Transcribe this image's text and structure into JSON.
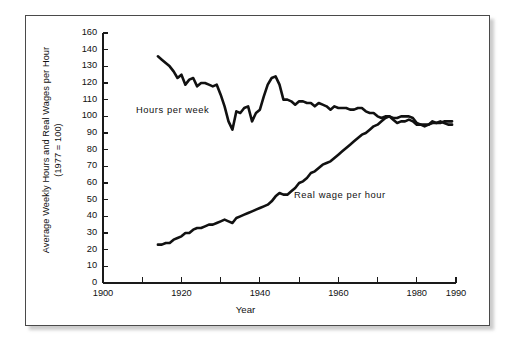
{
  "figure": {
    "y_axis_title_line1": "Average Weekly Hours and Real Wages per Hour",
    "y_axis_title_line2": "(1977 = 100)",
    "x_axis_title": "Year",
    "line_color": "#111111",
    "axis_color": "#1a1a1a",
    "frame_color": "#4a4a4a",
    "background": "#ffffff"
  },
  "chart_data": {
    "type": "line",
    "title": "",
    "subtitle": "",
    "xlabel": "Year",
    "ylabel": "Average Weekly Hours and Real Wages per Hour (1977 = 100)",
    "xlim": [
      1900,
      1990
    ],
    "ylim": [
      0,
      160
    ],
    "grid": false,
    "legend_position": "inline-annotations",
    "x_ticks": [
      1900,
      1910,
      1920,
      1930,
      1940,
      1950,
      1960,
      1970,
      1980,
      1990
    ],
    "x_tick_labels": [
      "1900",
      "",
      "1920",
      "",
      "1940",
      "",
      "1960",
      "",
      "1980",
      "1990"
    ],
    "y_ticks": [
      0,
      10,
      20,
      30,
      40,
      50,
      60,
      70,
      80,
      90,
      100,
      110,
      120,
      130,
      140,
      160
    ],
    "y_tick_labels": [
      "0",
      "10",
      "20",
      "30",
      "40",
      "50",
      "60",
      "70",
      "80",
      "90",
      "100",
      "110",
      "120",
      "130",
      "140",
      "160"
    ],
    "annotations": [
      {
        "text": "Hours per week",
        "x": 1920,
        "y": 110
      },
      {
        "text": "Real wage per hour",
        "x": 1958,
        "y": 55
      }
    ],
    "series": [
      {
        "name": "Hours per week",
        "label": "Hours per week",
        "color": "#111111",
        "x": [
          1914,
          1915,
          1916,
          1917,
          1918,
          1919,
          1920,
          1921,
          1922,
          1923,
          1924,
          1925,
          1926,
          1927,
          1928,
          1929,
          1930,
          1931,
          1932,
          1933,
          1934,
          1935,
          1936,
          1937,
          1938,
          1939,
          1940,
          1941,
          1942,
          1943,
          1944,
          1945,
          1946,
          1947,
          1948,
          1949,
          1950,
          1951,
          1952,
          1953,
          1954,
          1955,
          1956,
          1957,
          1958,
          1959,
          1960,
          1961,
          1962,
          1963,
          1964,
          1965,
          1966,
          1967,
          1968,
          1969,
          1970,
          1971,
          1972,
          1973,
          1974,
          1975,
          1976,
          1977,
          1978,
          1979,
          1980,
          1981,
          1982,
          1983,
          1984,
          1985,
          1986,
          1987,
          1988,
          1989
        ],
        "y": [
          136,
          134,
          132,
          130,
          127,
          123,
          125,
          119,
          122,
          123,
          118,
          120,
          120,
          119,
          118,
          119,
          113,
          106,
          97,
          92,
          103,
          102,
          105,
          106,
          97,
          102,
          104,
          112,
          119,
          123,
          124,
          119,
          110,
          110,
          109,
          107,
          109,
          109,
          108,
          108,
          106,
          108,
          107,
          106,
          104,
          106,
          105,
          105,
          105,
          104,
          104,
          105,
          105,
          103,
          102,
          102,
          100,
          99,
          100,
          100,
          98,
          96,
          97,
          97,
          98,
          97,
          95,
          95,
          94,
          95,
          97,
          96,
          96,
          97,
          97,
          97
        ]
      },
      {
        "name": "Real wage per hour",
        "label": "Real wage per hour",
        "color": "#111111",
        "x": [
          1914,
          1915,
          1916,
          1917,
          1918,
          1919,
          1920,
          1921,
          1922,
          1923,
          1924,
          1925,
          1926,
          1927,
          1928,
          1929,
          1930,
          1931,
          1932,
          1933,
          1934,
          1935,
          1936,
          1937,
          1938,
          1939,
          1940,
          1941,
          1942,
          1943,
          1944,
          1945,
          1946,
          1947,
          1948,
          1949,
          1950,
          1951,
          1952,
          1953,
          1954,
          1955,
          1956,
          1957,
          1958,
          1959,
          1960,
          1961,
          1962,
          1963,
          1964,
          1965,
          1966,
          1967,
          1968,
          1969,
          1970,
          1971,
          1972,
          1973,
          1974,
          1975,
          1976,
          1977,
          1978,
          1979,
          1980,
          1981,
          1982,
          1983,
          1984,
          1985,
          1986,
          1987,
          1988,
          1989
        ],
        "y": [
          23,
          23,
          24,
          24,
          26,
          27,
          28,
          30,
          30,
          32,
          33,
          33,
          34,
          35,
          35,
          36,
          37,
          38,
          37,
          36,
          39,
          40,
          41,
          42,
          43,
          44,
          45,
          46,
          47,
          49,
          52,
          54,
          53,
          53,
          55,
          57,
          60,
          61,
          63,
          66,
          67,
          69,
          71,
          72,
          73,
          75,
          77,
          79,
          81,
          83,
          85,
          87,
          89,
          90,
          92,
          94,
          95,
          97,
          99,
          100,
          99,
          99,
          100,
          100,
          100,
          99,
          96,
          95,
          95,
          95,
          96,
          96,
          97,
          96,
          95,
          95
        ]
      }
    ]
  }
}
